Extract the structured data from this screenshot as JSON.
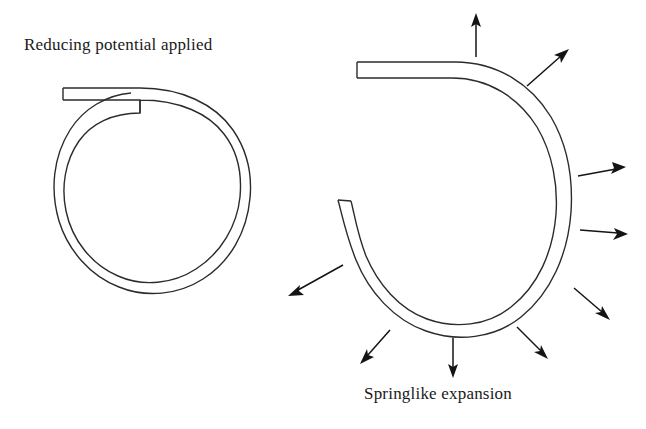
{
  "page": {
    "width": 646,
    "height": 429,
    "background": "#ffffff",
    "ink_color": "#2b2b2b",
    "arrow_color": "#141414"
  },
  "labels": {
    "left_caption": "Reducing potential applied",
    "right_caption": "Springlike expansion"
  },
  "diagram": {
    "type": "schematic",
    "shapes": [
      {
        "name": "coiled-spiral-closed",
        "side": "left",
        "center": [
          152,
          192
        ],
        "outer_radius_x": 97,
        "outer_radius_y": 100,
        "band_width": 10,
        "tail": {
          "type": "straight-tangential-strip",
          "from": [
            62,
            94
          ],
          "to": [
            140,
            94
          ],
          "thickness": 12
        }
      },
      {
        "name": "coiled-spiral-expanded",
        "side": "right",
        "center": [
          464,
          197
        ],
        "outer_radius_x": 107,
        "outer_radius_y": 133,
        "band_width": 13,
        "gap_side": "left",
        "tail": {
          "type": "straight-tangential-strip",
          "from": [
            356,
            70
          ],
          "to": [
            452,
            70
          ],
          "thickness": 16
        },
        "open_end": {
          "position": [
            338,
            200
          ],
          "cap": "flat"
        }
      }
    ],
    "arrows": [
      {
        "name": "arrow-up",
        "direction": "up",
        "from": [
          476,
          57
        ],
        "to": [
          476,
          15
        ]
      },
      {
        "name": "arrow-up-right",
        "direction": "up-right",
        "from": [
          527,
          86
        ],
        "to": [
          567,
          50
        ]
      },
      {
        "name": "arrow-right-upper",
        "direction": "right",
        "from": [
          578,
          176
        ],
        "to": [
          624,
          168
        ]
      },
      {
        "name": "arrow-right-lower",
        "direction": "right",
        "from": [
          580,
          230
        ],
        "to": [
          626,
          234
        ]
      },
      {
        "name": "arrow-down-right-far",
        "direction": "down-right",
        "from": [
          574,
          288
        ],
        "to": [
          607,
          318
        ]
      },
      {
        "name": "arrow-down-right",
        "direction": "down-right",
        "from": [
          517,
          327
        ],
        "to": [
          545,
          357
        ]
      },
      {
        "name": "arrow-down",
        "direction": "down",
        "from": [
          453,
          338
        ],
        "to": [
          453,
          375
        ]
      },
      {
        "name": "arrow-down-left",
        "direction": "down-left",
        "from": [
          390,
          330
        ],
        "to": [
          363,
          362
        ]
      },
      {
        "name": "arrow-left-down",
        "direction": "down-left",
        "from": [
          343,
          265
        ],
        "to": [
          291,
          294
        ]
      }
    ]
  }
}
